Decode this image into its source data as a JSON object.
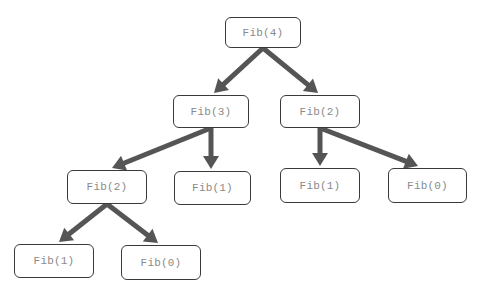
{
  "diagram": {
    "type": "tree",
    "title": "",
    "colors": {
      "edge": "#555555",
      "node_border": "#3a3a3a",
      "node_text": "#8a8a8a",
      "background": "#ffffff"
    },
    "nodes": [
      {
        "id": "n0",
        "label": "Fib(4)",
        "x": 225,
        "y": 17,
        "w": 76,
        "h": 31
      },
      {
        "id": "n1",
        "label": "Fib(3)",
        "x": 173,
        "y": 95,
        "w": 76,
        "h": 33
      },
      {
        "id": "n2",
        "label": "Fib(2)",
        "x": 280,
        "y": 95,
        "w": 80,
        "h": 33
      },
      {
        "id": "n3",
        "label": "Fib(2)",
        "x": 67,
        "y": 170,
        "w": 80,
        "h": 34
      },
      {
        "id": "n4",
        "label": "Fib(1)",
        "x": 174,
        "y": 171,
        "w": 77,
        "h": 34
      },
      {
        "id": "n5",
        "label": "Fib(1)",
        "x": 280,
        "y": 168,
        "w": 80,
        "h": 35
      },
      {
        "id": "n6",
        "label": "Fib(0)",
        "x": 388,
        "y": 168,
        "w": 79,
        "h": 35
      },
      {
        "id": "n7",
        "label": "Fib(1)",
        "x": 14,
        "y": 244,
        "w": 80,
        "h": 34
      },
      {
        "id": "n8",
        "label": "Fib(0)",
        "x": 121,
        "y": 245,
        "w": 80,
        "h": 35
      }
    ],
    "edges": [
      {
        "from": "n0",
        "to": "n1",
        "x1": 263,
        "y1": 48,
        "x2": 214,
        "y2": 93
      },
      {
        "from": "n0",
        "to": "n2",
        "x1": 263,
        "y1": 48,
        "x2": 318,
        "y2": 93
      },
      {
        "from": "n1",
        "to": "n3",
        "x1": 211,
        "y1": 128,
        "x2": 112,
        "y2": 168
      },
      {
        "from": "n1",
        "to": "n4",
        "x1": 211,
        "y1": 128,
        "x2": 211,
        "y2": 169
      },
      {
        "from": "n2",
        "to": "n5",
        "x1": 320,
        "y1": 128,
        "x2": 320,
        "y2": 166
      },
      {
        "from": "n2",
        "to": "n6",
        "x1": 320,
        "y1": 128,
        "x2": 418,
        "y2": 166
      },
      {
        "from": "n3",
        "to": "n7",
        "x1": 107,
        "y1": 204,
        "x2": 59,
        "y2": 242
      },
      {
        "from": "n3",
        "to": "n8",
        "x1": 107,
        "y1": 204,
        "x2": 158,
        "y2": 243
      }
    ]
  }
}
